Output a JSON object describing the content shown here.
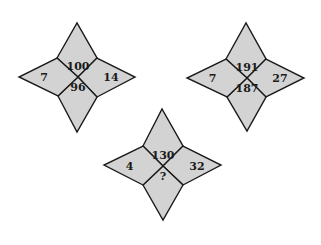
{
  "puzzle": {
    "fill_color": "#d3d3d3",
    "stroke_color": "#1a1a1a",
    "stars": [
      {
        "id": "star-1",
        "center": [
          78,
          77
        ],
        "tips": {
          "top": [
            77,
            23
          ],
          "right": [
            135,
            77
          ],
          "bottom": [
            77,
            132
          ],
          "left": [
            19,
            77
          ]
        },
        "inner": {
          "top_left": [
            57,
            58
          ],
          "top_right": [
            97,
            58
          ],
          "bottom_right": [
            97,
            97
          ],
          "bottom_left": [
            58,
            96
          ]
        },
        "values": {
          "top": "100",
          "right": "14",
          "bottom": "96",
          "left": "7"
        }
      },
      {
        "id": "star-2",
        "center": [
          247,
          78
        ],
        "tips": {
          "top": [
            246,
            23
          ],
          "right": [
            304,
            78
          ],
          "bottom": [
            247,
            131
          ],
          "left": [
            187,
            78
          ]
        },
        "inner": {
          "top_left": [
            226,
            59
          ],
          "top_right": [
            266,
            59
          ],
          "bottom_right": [
            266,
            97
          ],
          "bottom_left": [
            227,
            97
          ]
        },
        "values": {
          "top": "191",
          "right": "27",
          "bottom": "187",
          "left": "7"
        }
      },
      {
        "id": "star-3",
        "center": [
          163,
          166
        ],
        "tips": {
          "top": [
            162,
            109
          ],
          "right": [
            221,
            165
          ],
          "bottom": [
            163,
            220
          ],
          "left": [
            104,
            165
          ]
        },
        "inner": {
          "top_left": [
            143,
            146
          ],
          "top_right": [
            183,
            146
          ],
          "bottom_right": [
            183,
            185
          ],
          "bottom_left": [
            143,
            185
          ]
        },
        "values": {
          "top": "130",
          "right": "32",
          "bottom": "?",
          "left": "4"
        }
      }
    ]
  }
}
